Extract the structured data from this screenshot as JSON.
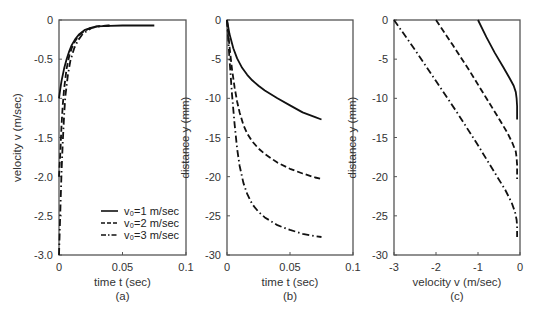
{
  "chart_data": [
    {
      "id": "a",
      "type": "line",
      "panel_label": "(a)",
      "title": "",
      "xlabel": "time t (sec)",
      "ylabel": "velocity v (m/sec)",
      "xlim": [
        0,
        0.1
      ],
      "ylim": [
        -3.0,
        0
      ],
      "xticks": [
        "0",
        "0.05",
        "0.1"
      ],
      "yticks": [
        "0",
        "-0.5",
        "-1.0",
        "-1.5",
        "-2.0",
        "-2.5",
        "-3.0"
      ],
      "grid": false,
      "legend_position": "lower right",
      "series": [
        {
          "name": "v0=1 m/sec",
          "style": "solid",
          "x": [
            0,
            0.001,
            0.002,
            0.004,
            0.006,
            0.008,
            0.01,
            0.013,
            0.016,
            0.02,
            0.025,
            0.03,
            0.04,
            0.05,
            0.06,
            0.07,
            0.075
          ],
          "y": [
            -1.0,
            -0.88,
            -0.78,
            -0.62,
            -0.5,
            -0.4,
            -0.32,
            -0.24,
            -0.18,
            -0.13,
            -0.1,
            -0.08,
            -0.075,
            -0.07,
            -0.07,
            -0.07,
            -0.07
          ]
        },
        {
          "name": "v0=2 m/sec",
          "style": "dashed",
          "x": [
            0,
            0.001,
            0.002,
            0.003,
            0.004,
            0.006,
            0.008,
            0.01,
            0.013,
            0.016,
            0.02,
            0.025,
            0.03,
            0.035,
            0.04
          ],
          "y": [
            -2.0,
            -1.7,
            -1.35,
            -1.08,
            -0.88,
            -0.62,
            -0.46,
            -0.36,
            -0.26,
            -0.19,
            -0.14,
            -0.1,
            -0.08,
            -0.075,
            -0.07
          ]
        },
        {
          "name": "v0=3 m/sec",
          "style": "dashdot",
          "x": [
            0,
            0.001,
            0.002,
            0.003,
            0.004,
            0.005,
            0.007,
            0.009,
            0.012,
            0.015,
            0.018,
            0.022,
            0.026,
            0.03,
            0.035,
            0.04
          ],
          "y": [
            -3.0,
            -2.45,
            -1.95,
            -1.55,
            -1.22,
            -0.98,
            -0.7,
            -0.52,
            -0.36,
            -0.26,
            -0.19,
            -0.14,
            -0.1,
            -0.085,
            -0.075,
            -0.07
          ]
        }
      ]
    },
    {
      "id": "b",
      "type": "line",
      "panel_label": "(b)",
      "title": "",
      "xlabel": "time t (sec)",
      "ylabel": "distance y (mm)",
      "xlim": [
        0,
        0.1
      ],
      "ylim": [
        -30,
        0
      ],
      "xticks": [
        "0",
        "0.05",
        "0.1"
      ],
      "yticks": [
        "0",
        "-5",
        "-10",
        "-15",
        "-20",
        "-25",
        "-30"
      ],
      "grid": false,
      "series": [
        {
          "name": "v0=1 m/sec",
          "style": "solid",
          "x": [
            0,
            0.002,
            0.005,
            0.008,
            0.012,
            0.016,
            0.02,
            0.025,
            0.03,
            0.04,
            0.05,
            0.06,
            0.07,
            0.075
          ],
          "y": [
            0,
            -1.8,
            -3.6,
            -4.9,
            -6.1,
            -7.0,
            -7.7,
            -8.4,
            -9.0,
            -10.0,
            -10.9,
            -11.8,
            -12.4,
            -12.7
          ]
        },
        {
          "name": "v0=2 m/sec",
          "style": "dashed",
          "x": [
            0,
            0.002,
            0.004,
            0.006,
            0.008,
            0.01,
            0.013,
            0.016,
            0.02,
            0.025,
            0.03,
            0.04,
            0.05,
            0.06,
            0.07,
            0.075
          ],
          "y": [
            0,
            -3.4,
            -6.3,
            -8.6,
            -10.4,
            -11.8,
            -13.4,
            -14.5,
            -15.5,
            -16.4,
            -17.1,
            -18.2,
            -19.0,
            -19.6,
            -20.1,
            -20.3
          ]
        },
        {
          "name": "v0=3 m/sec",
          "style": "dashdot",
          "x": [
            0,
            0.002,
            0.004,
            0.006,
            0.008,
            0.01,
            0.013,
            0.016,
            0.02,
            0.025,
            0.03,
            0.04,
            0.05,
            0.06,
            0.07,
            0.075
          ],
          "y": [
            0,
            -5.0,
            -9.5,
            -13.3,
            -16.4,
            -18.6,
            -20.8,
            -22.2,
            -23.5,
            -24.5,
            -25.2,
            -26.2,
            -26.8,
            -27.3,
            -27.6,
            -27.7
          ]
        }
      ]
    },
    {
      "id": "c",
      "type": "line",
      "panel_label": "(c)",
      "title": "",
      "xlabel": "velocity v (m/sec)",
      "ylabel": "distance y (mm)",
      "xlim": [
        -3,
        0
      ],
      "ylim": [
        -30,
        0
      ],
      "xticks": [
        "-3",
        "-2",
        "-1",
        "0"
      ],
      "yticks": [
        "0",
        "-5",
        "-10",
        "-15",
        "-20",
        "-25",
        "-30"
      ],
      "grid": false,
      "series": [
        {
          "name": "v0=1 m/sec",
          "style": "solid",
          "x": [
            -1.0,
            -0.8,
            -0.6,
            -0.4,
            -0.25,
            -0.15,
            -0.1,
            -0.08,
            -0.07,
            -0.07
          ],
          "y": [
            0,
            -2.2,
            -4.2,
            -6.0,
            -7.4,
            -8.4,
            -9.2,
            -10.0,
            -11.0,
            -12.7
          ]
        },
        {
          "name": "v0=2 m/sec",
          "style": "dashed",
          "x": [
            -2.0,
            -1.6,
            -1.2,
            -0.8,
            -0.5,
            -0.3,
            -0.18,
            -0.1,
            -0.08,
            -0.07,
            -0.07
          ],
          "y": [
            0,
            -3.2,
            -6.5,
            -10.0,
            -12.6,
            -14.4,
            -15.7,
            -16.8,
            -17.6,
            -18.5,
            -20.3
          ]
        },
        {
          "name": "v0=3 m/sec",
          "style": "dashdot",
          "x": [
            -3.0,
            -2.5,
            -2.0,
            -1.5,
            -1.0,
            -0.6,
            -0.35,
            -0.2,
            -0.12,
            -0.08,
            -0.07,
            -0.07
          ],
          "y": [
            0,
            -3.8,
            -7.8,
            -11.8,
            -16.0,
            -19.5,
            -21.7,
            -23.3,
            -24.5,
            -25.5,
            -26.3,
            -27.7
          ]
        }
      ]
    }
  ],
  "legend": {
    "items": [
      {
        "label": "v₀=1 m/sec",
        "style": "solid"
      },
      {
        "label": "v₀=2 m/sec",
        "style": "dashed"
      },
      {
        "label": "v₀=3 m/sec",
        "style": "dashdot"
      }
    ]
  },
  "colors": {
    "line": "#111111",
    "frame": "#555555",
    "text": "#333333"
  }
}
